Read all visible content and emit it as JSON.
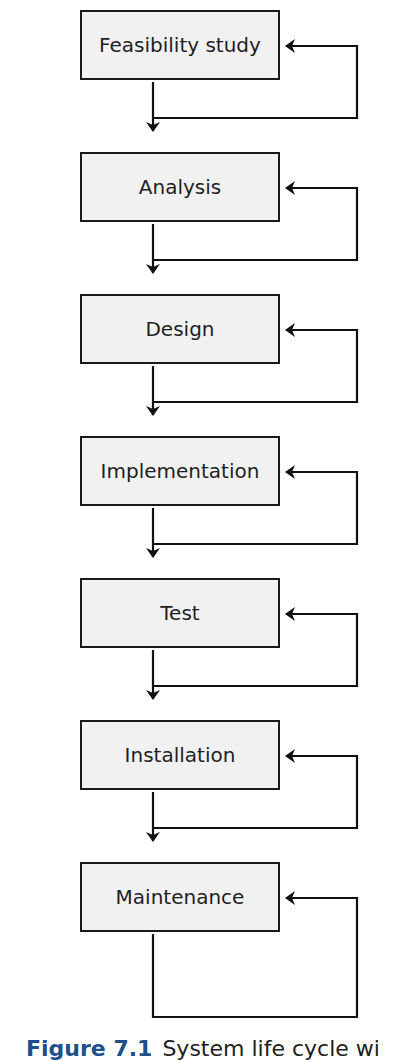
{
  "diagram": {
    "type": "flowchart",
    "title": "System life cycle",
    "stages": [
      {
        "label": "Feasibility study"
      },
      {
        "label": "Analysis"
      },
      {
        "label": "Design"
      },
      {
        "label": "Implementation"
      },
      {
        "label": "Test"
      },
      {
        "label": "Installation"
      },
      {
        "label": "Maintenance"
      }
    ],
    "edges": [
      {
        "from": "Feasibility study",
        "to": "Analysis"
      },
      {
        "from": "Feasibility study",
        "to": "Feasibility study",
        "kind": "feedback"
      },
      {
        "from": "Analysis",
        "to": "Design"
      },
      {
        "from": "Analysis",
        "to": "Analysis",
        "kind": "feedback"
      },
      {
        "from": "Design",
        "to": "Implementation"
      },
      {
        "from": "Design",
        "to": "Design",
        "kind": "feedback"
      },
      {
        "from": "Implementation",
        "to": "Test"
      },
      {
        "from": "Implementation",
        "to": "Implementation",
        "kind": "feedback"
      },
      {
        "from": "Test",
        "to": "Installation"
      },
      {
        "from": "Test",
        "to": "Test",
        "kind": "feedback"
      },
      {
        "from": "Installation",
        "to": "Maintenance"
      },
      {
        "from": "Installation",
        "to": "Installation",
        "kind": "feedback"
      },
      {
        "from": "Maintenance",
        "to": "Maintenance",
        "kind": "feedback"
      }
    ],
    "colors": {
      "box_fill": "#f1f1f1",
      "stroke": "#1a1a1a",
      "caption_accent": "#1d4f8a"
    }
  },
  "caption": {
    "figure_label": "Figure 7.1",
    "text": "System life cycle wi"
  }
}
